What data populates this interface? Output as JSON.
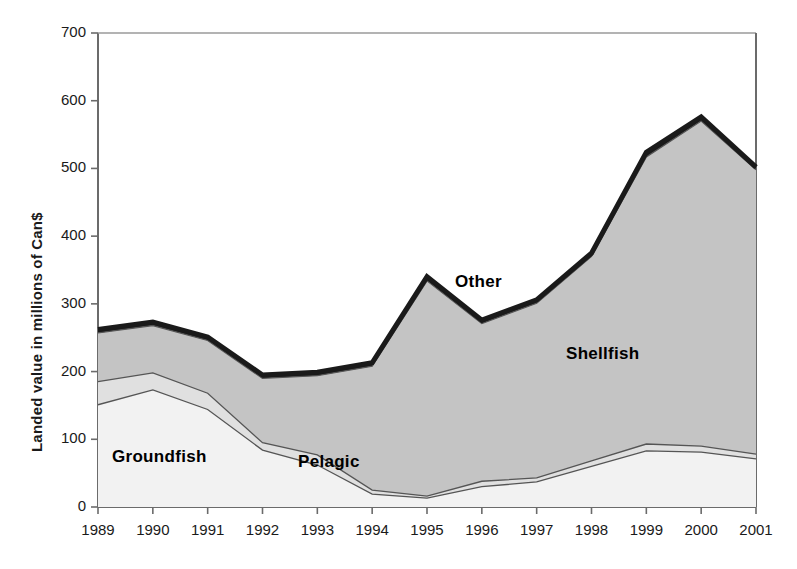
{
  "chart_data": {
    "type": "area",
    "stacked": true,
    "title": "",
    "subtitle": "",
    "xlabel": "",
    "ylabel": "Landed value in millions of Can$",
    "categories": [
      "1989",
      "1990",
      "1991",
      "1992",
      "1993",
      "1994",
      "1995",
      "1996",
      "1997",
      "1998",
      "1999",
      "2000",
      "2001"
    ],
    "x": [
      1989,
      1990,
      1991,
      1992,
      1993,
      1994,
      1995,
      1996,
      1997,
      1998,
      1999,
      2000,
      2001
    ],
    "xlim": [
      1989,
      2001
    ],
    "ylim": [
      0,
      700
    ],
    "yticks": [
      0,
      100,
      200,
      300,
      400,
      500,
      600,
      700
    ],
    "grid": false,
    "legend_position": "inline-annotations",
    "series": [
      {
        "name": "Groundfish",
        "fill": "#f2f2f2",
        "values": [
          151,
          173,
          144,
          84,
          62,
          19,
          13,
          30,
          37,
          60,
          83,
          81,
          71
        ]
      },
      {
        "name": "Pelagic",
        "fill": "#e0e0e0",
        "values": [
          34,
          25,
          24,
          11,
          15,
          6,
          3,
          8,
          6,
          8,
          10,
          9,
          7
        ]
      },
      {
        "name": "Shellfish",
        "fill": "#c4c4c4",
        "values": [
          72,
          70,
          78,
          95,
          117,
          183,
          318,
          233,
          258,
          302,
          424,
          480,
          420
        ]
      },
      {
        "name": "Other",
        "fill": "#1a1a1a",
        "values": [
          5,
          5,
          5,
          5,
          5,
          5,
          6,
          5,
          5,
          5,
          7,
          6,
          4
        ]
      }
    ],
    "cumulative_tops": {
      "groundfish": [
        151,
        173,
        144,
        84,
        62,
        19,
        13,
        30,
        37,
        60,
        83,
        81,
        71
      ],
      "pelagic": [
        185,
        198,
        168,
        95,
        77,
        25,
        16,
        38,
        43,
        68,
        93,
        90,
        78
      ],
      "shellfish": [
        257,
        268,
        246,
        190,
        194,
        208,
        334,
        271,
        301,
        370,
        517,
        570,
        498
      ],
      "total": [
        262,
        273,
        251,
        195,
        199,
        213,
        340,
        276,
        306,
        375,
        524,
        576,
        502
      ]
    },
    "annotations": [
      {
        "text": "Groundfish",
        "x_approx": 1990.6,
        "y_approx": 70
      },
      {
        "text": "Pelagic",
        "x_approx": 1993.4,
        "y_approx": 60
      },
      {
        "text": "Other",
        "x_approx": 1996.1,
        "y_approx": 307
      },
      {
        "text": "Shellfish",
        "x_approx": 1998.1,
        "y_approx": 205
      }
    ]
  }
}
